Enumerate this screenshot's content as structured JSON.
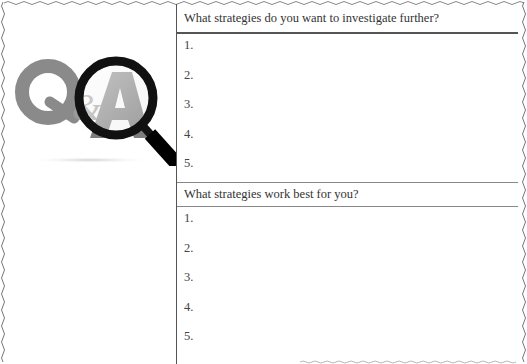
{
  "logo": {
    "icon": "q-and-a-magnifier-icon",
    "letters": [
      "Q",
      "&",
      "A"
    ]
  },
  "sections": [
    {
      "question": "What strategies do you want to investigate further?",
      "items": [
        "1.",
        "2.",
        "3.",
        "4.",
        "5."
      ]
    },
    {
      "question": "What strategies work best for you?",
      "items": [
        "1.",
        "2.",
        "3.",
        "4.",
        "5."
      ]
    }
  ],
  "colors": {
    "rule": "#555555",
    "text": "#333333",
    "logo_gray": "#8a8a8a",
    "magnifier": "#111111"
  }
}
